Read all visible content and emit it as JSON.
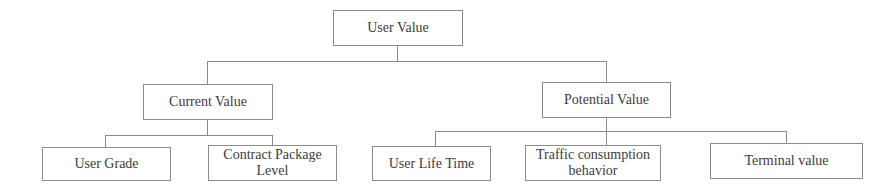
{
  "diagram": {
    "type": "tree",
    "root": {
      "label": "User Value",
      "children": [
        {
          "label": "Current Value",
          "children": [
            {
              "label": "User Grade"
            },
            {
              "label": "Contract Package Level"
            }
          ]
        },
        {
          "label": "Potential Value",
          "children": [
            {
              "label": "User Life Time"
            },
            {
              "label": "Traffic consumption behavior"
            },
            {
              "label": "Terminal value"
            }
          ]
        }
      ]
    }
  },
  "nodes": {
    "root": "User Value",
    "current": "Current Value",
    "potential": "Potential Value",
    "user_grade": "User Grade",
    "contract_package": "Contract Package Level",
    "user_life_time": "User Life Time",
    "traffic_behavior": "Traffic consumption behavior",
    "terminal_value": "Terminal value"
  },
  "colors": {
    "border": "#8c8c8c",
    "connector": "#8a8a8a",
    "text": "#3c3c3c",
    "background": "#ffffff"
  }
}
